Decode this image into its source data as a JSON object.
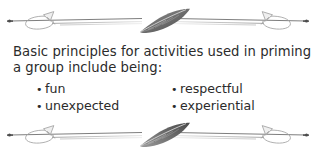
{
  "page": {
    "background_color": "#ffffff",
    "text_color": "#2b2b2b",
    "ornament_color": "#8a8a8a",
    "ornament_dark_color": "#5e5e5e"
  },
  "content": {
    "lead_line_1": "Basic principles for activities used in priming",
    "lead_line_2": "a group include being:",
    "bullet_glyph": "•",
    "columns": [
      {
        "items": [
          "fun",
          "unexpected"
        ]
      },
      {
        "items": [
          "respectful",
          "experiential"
        ]
      }
    ]
  },
  "ornaments": {
    "top": {
      "name": "quill-arrow-divider-top",
      "center_motif": "feather",
      "left_end": "dot-and-looped-arrowhead",
      "right_end": "dot-and-looped-arrowhead"
    },
    "bottom": {
      "name": "quill-arrow-divider-bottom",
      "center_motif": "feather",
      "left_end": "dot-and-looped-arrowhead",
      "right_end": "dot-and-looped-arrowhead"
    }
  }
}
